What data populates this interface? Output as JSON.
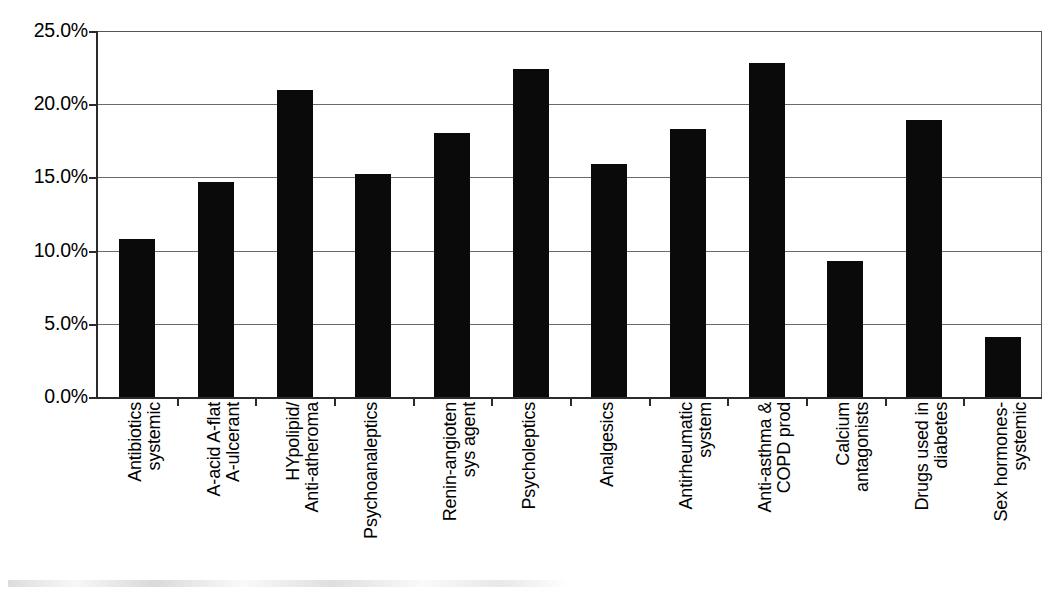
{
  "chart_data": {
    "type": "bar",
    "title": "",
    "subtitle": "",
    "xlabel": "",
    "ylabel": "",
    "ylim": [
      0,
      25
    ],
    "y_ticks": [
      "0.0%",
      "5.0%",
      "10.0%",
      "15.0%",
      "20.0%",
      "25.0%"
    ],
    "y_tick_values": [
      0,
      5,
      10,
      15,
      20,
      25
    ],
    "grid": "horizontal",
    "legend": "none",
    "bar_color": "#0a0a0a",
    "value_unit": "%",
    "categories": [
      "Antibiotics systemic",
      "A-acid A-flat A-ulcerant",
      "HYpolipid/ Anti-atheroma",
      "Psychoanaleptics",
      "Renin-angioten sys agent",
      "Psycholeptics",
      "Analgesics",
      "Antirheumatic system",
      "Anti-asthma & COPD prod",
      "Calcium antagonists",
      "Drugs used in diabetes",
      "Sex hormones-systemic"
    ],
    "category_lines": [
      [
        "Antibiotics",
        "systemic"
      ],
      [
        "A-acid A-flat",
        "A-ulcerant"
      ],
      [
        "HYpolipid/",
        "Anti-atheroma"
      ],
      [
        "Psychoanaleptics",
        ""
      ],
      [
        "Renin-angioten",
        "sys agent"
      ],
      [
        "Psycholeptics",
        ""
      ],
      [
        "Analgesics",
        ""
      ],
      [
        "Antirheumatic",
        "system"
      ],
      [
        "Anti-asthma &",
        "COPD prod"
      ],
      [
        "Calcium",
        "antagonists"
      ],
      [
        "Drugs used in",
        "diabetes"
      ],
      [
        "Sex hormones-",
        "systemic"
      ]
    ],
    "values": [
      10.8,
      14.7,
      21.0,
      15.2,
      18.0,
      22.4,
      15.9,
      18.3,
      22.8,
      9.3,
      18.9,
      4.1
    ],
    "value_labels": [
      "10.8%",
      "14.7%",
      "21.0%",
      "15.2%",
      "18.0%",
      "22.4%",
      "15.9%",
      "18.3%",
      "22.8%",
      "9.3%",
      "18.9%",
      "4.1%"
    ]
  }
}
